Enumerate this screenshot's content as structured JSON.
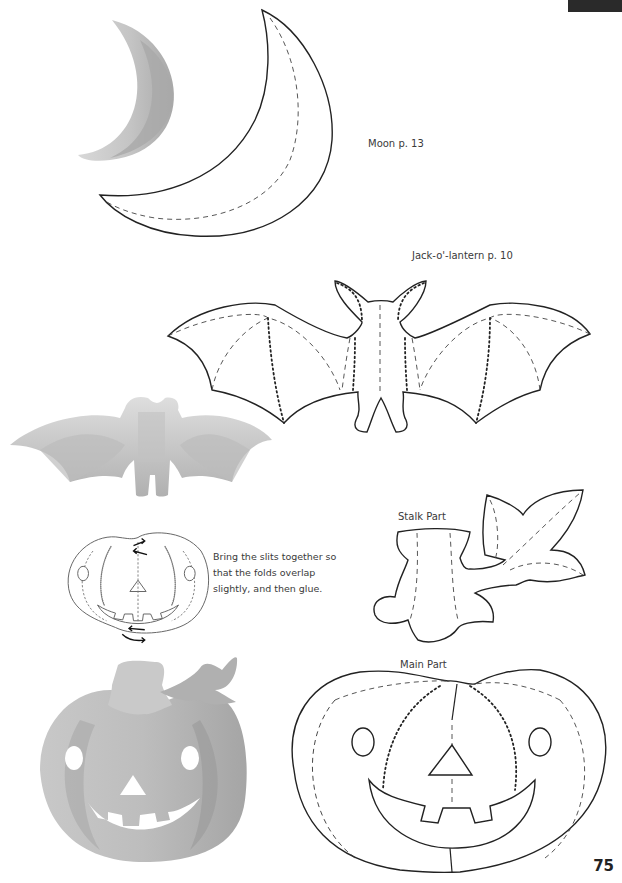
{
  "page": {
    "number": "75",
    "corner_tab_color": "#2a2a2a"
  },
  "labels": {
    "moon": "Moon  p. 13",
    "bat": "Jack-o'-lantern  p. 10",
    "stalk": "Stalk Part",
    "main": "Main Part"
  },
  "instructions": {
    "text": "Bring the slits together so that the folds overlap slightly, and then glue."
  },
  "legend_lines": {
    "cut": "solid",
    "valley_fold": "dashed",
    "mountain_fold": "dotted"
  },
  "colors": {
    "model_light": "#d4d4d4",
    "model_mid": "#b5b5b5",
    "model_dark": "#999999",
    "outline": "#222222"
  }
}
